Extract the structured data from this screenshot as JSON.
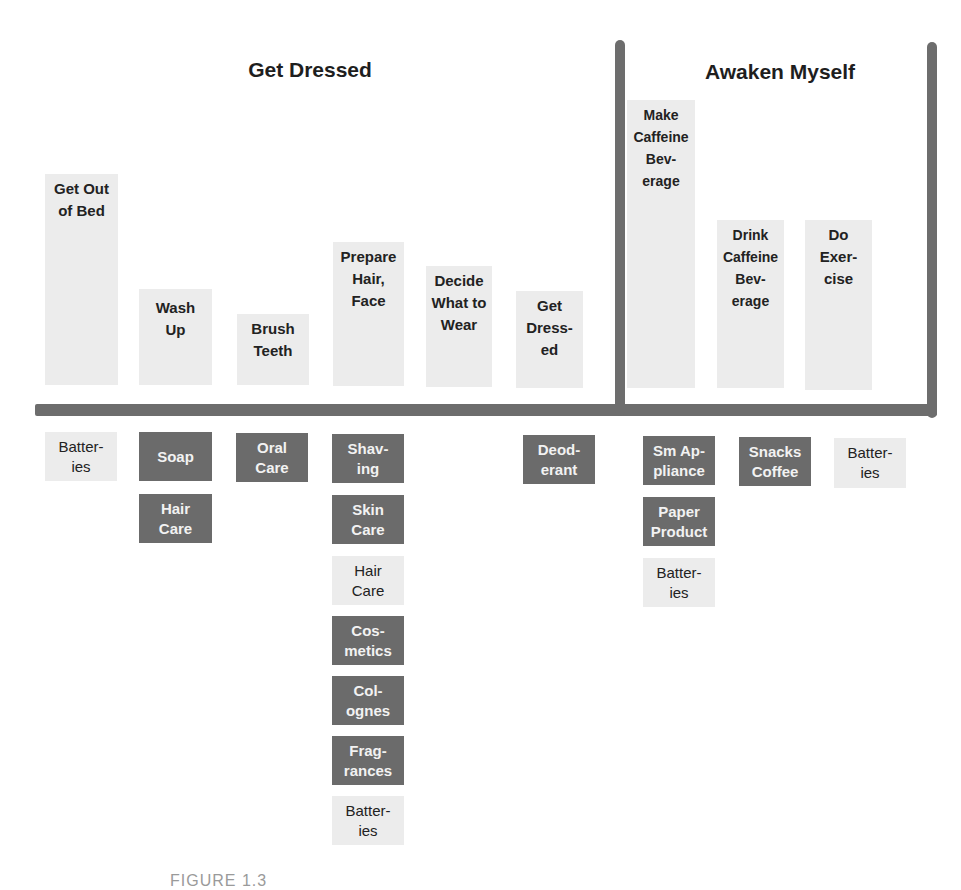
{
  "groups": [
    {
      "title": "Get Dressed"
    },
    {
      "title": "Awaken Myself"
    }
  ],
  "tasks": [
    {
      "label": "Get Out\nof Bed"
    },
    {
      "label": "Wash\nUp"
    },
    {
      "label": "Brush\nTeeth"
    },
    {
      "label": "Prepare\nHair,\nFace"
    },
    {
      "label": "Decide\nWhat to\nWear"
    },
    {
      "label": "Get\nDress-\ned"
    },
    {
      "label": "Make\nCaffeine\nBev-\nerage"
    },
    {
      "label": "Drink\nCaffeine\nBev-\nerage"
    },
    {
      "label": "Do\nExer-\ncise"
    }
  ],
  "products": {
    "get_out_of_bed": [
      {
        "label": "Batter-\nies",
        "style": "light"
      }
    ],
    "wash_up": [
      {
        "label": "Soap",
        "style": "dark"
      },
      {
        "label": "Hair\nCare",
        "style": "dark"
      }
    ],
    "brush_teeth": [
      {
        "label": "Oral\nCare",
        "style": "dark"
      }
    ],
    "prepare_hair_face": [
      {
        "label": "Shav-\ning",
        "style": "dark"
      },
      {
        "label": "Skin\nCare",
        "style": "dark"
      },
      {
        "label": "Hair\nCare",
        "style": "light"
      },
      {
        "label": "Cos-\nmetics",
        "style": "dark"
      },
      {
        "label": "Col-\nognes",
        "style": "dark"
      },
      {
        "label": "Frag-\nrances",
        "style": "dark"
      },
      {
        "label": "Batter-\nies",
        "style": "light"
      }
    ],
    "get_dressed": [
      {
        "label": "Deod-\nerant",
        "style": "dark"
      }
    ],
    "make_caffeine_beverage": [
      {
        "label": "Sm Ap-\npliance",
        "style": "dark"
      },
      {
        "label": "Paper\nProduct",
        "style": "dark"
      },
      {
        "label": "Batter-\nies",
        "style": "light"
      }
    ],
    "drink_caffeine_beverage": [
      {
        "label": "Snacks\nCoffee",
        "style": "dark"
      }
    ],
    "do_exercise": [
      {
        "label": "Batter-\nies",
        "style": "light"
      }
    ]
  },
  "caption": "FIGURE 1.3",
  "colors": {
    "bar": "#6d6d6d",
    "dark_box": "#6b6b6b",
    "light_box": "#ececec"
  }
}
